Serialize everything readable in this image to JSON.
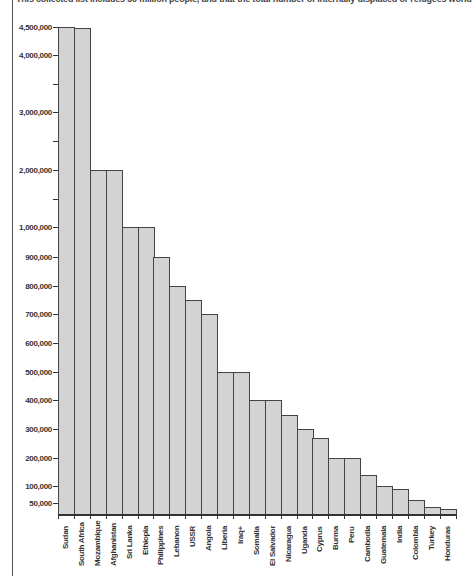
{
  "header": {
    "text": "This collected list includes 30 million people, and that the total number of internally displaced or refugees worldwide exceeds this by a large margin"
  },
  "chart_data": {
    "type": "bar",
    "title": "",
    "xlabel": "",
    "ylabel": "",
    "y_scale": "broken/non-linear (compressed above 1,000,000)",
    "ylim": [
      0,
      4500000
    ],
    "grid": false,
    "legend": null,
    "y_ticks": [
      "4,500,000",
      "4,000,000",
      "3,000,000",
      "2,000,000",
      "1,000,000",
      "900,000",
      "800,000",
      "700,000",
      "600,000",
      "500,000",
      "400,000",
      "300,000",
      "200,000",
      "100,000",
      "50,000"
    ],
    "categories": [
      "Sudan",
      "South Africa",
      "Mozambique",
      "Afghanistan",
      "Sri Lanka",
      "Ethiopia",
      "Philippines",
      "Lebanon",
      "USSR",
      "Angola",
      "Liberia",
      "Iraq+",
      "Somalia",
      "El Salvador",
      "Nicaragua",
      "Uganda",
      "Cyprus",
      "Burma",
      "Peru",
      "Cambodia",
      "Guatemala",
      "India",
      "Colombia",
      "Turkey",
      "Honduras"
    ],
    "values": [
      4500000,
      4480000,
      2000000,
      2000000,
      1000000,
      1000000,
      900000,
      800000,
      750000,
      700000,
      500000,
      500000,
      400000,
      400000,
      350000,
      300000,
      270000,
      200000,
      200000,
      140000,
      100000,
      90000,
      60000,
      35000,
      25000
    ]
  }
}
